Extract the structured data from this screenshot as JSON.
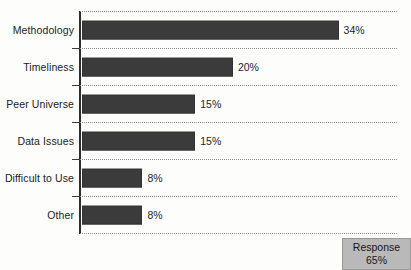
{
  "chart_data": {
    "type": "bar",
    "orientation": "horizontal",
    "title": "",
    "subtitle": "",
    "xlabel": "",
    "ylabel": "",
    "categories": [
      "Methodology",
      "Timeliness",
      "Peer Universe",
      "Data Issues",
      "Difficult to Use",
      "Other"
    ],
    "values": [
      34,
      20,
      15,
      15,
      8,
      8
    ],
    "value_labels": [
      "34%",
      "20%",
      "15%",
      "15%",
      "8%",
      "8%"
    ],
    "unit": "%",
    "xlim": [
      0,
      42
    ],
    "grid": "horizontal-dotted",
    "legend": "none",
    "series": [
      {
        "name": "Response share",
        "values": [
          34,
          20,
          15,
          15,
          8,
          8
        ]
      }
    ],
    "annotations": [
      {
        "name": "response-rate",
        "line1": "Response",
        "line2": "65%",
        "position": "bottom-right"
      }
    ],
    "colors": {
      "bar": "#3b3b3b",
      "axis": "#2e2e2e",
      "grid": "#8d8d8d",
      "annotation_bg": "#b9b9b9",
      "text": "#1f1f1f",
      "background": "#fdfdfc"
    }
  }
}
